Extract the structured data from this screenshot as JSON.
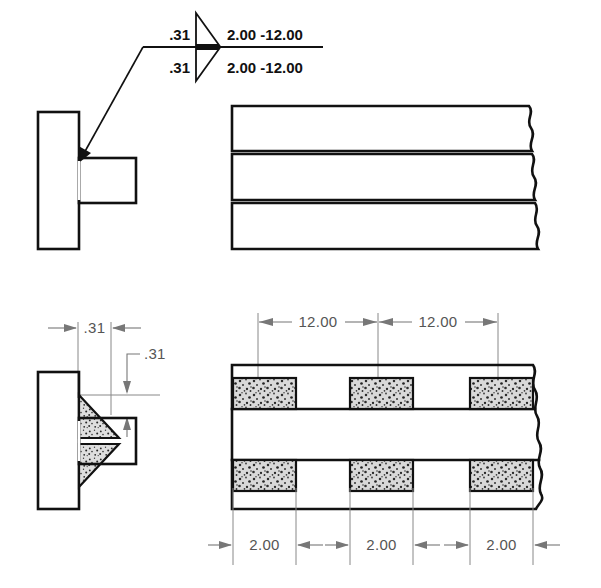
{
  "drawing": {
    "title": "Chain intermittent fillet weld symbol and views",
    "line_color": "#111111",
    "dimension_color": "#777777",
    "weld_fill_color": "#d8d8d8"
  },
  "weld_symbol": {
    "name": "chain-intermittent-fillet-weld-symbol",
    "arrow_side": {
      "leg_size": ".31",
      "length_pitch": "2.00 -12.00"
    },
    "other_side": {
      "leg_size": ".31",
      "length_pitch": "2.00 -12.00"
    },
    "weld_type": "fillet",
    "both_sides": true
  },
  "views": {
    "top_left": {
      "name": "section-view-tee-joint",
      "label": ""
    },
    "top_right": {
      "name": "plan-view-plate",
      "label": ""
    },
    "bottom_left": {
      "name": "section-view-fillet-welds",
      "label": "",
      "dimensions": [
        {
          "name": "weld-leg-horizontal",
          "value": ".31"
        },
        {
          "name": "weld-leg-vertical",
          "value": ".31"
        }
      ]
    },
    "bottom_right": {
      "name": "plan-view-intermittent-welds",
      "label": "",
      "pitch_dimensions": [
        {
          "name": "pitch-1",
          "value": "12.00"
        },
        {
          "name": "pitch-2",
          "value": "12.00"
        }
      ],
      "length_dimensions": [
        {
          "name": "length-1",
          "value": "2.00"
        },
        {
          "name": "length-2",
          "value": "2.00"
        },
        {
          "name": "length-3",
          "value": "2.00"
        }
      ],
      "weld_segments_top": 3,
      "weld_segments_bottom": 3
    }
  }
}
